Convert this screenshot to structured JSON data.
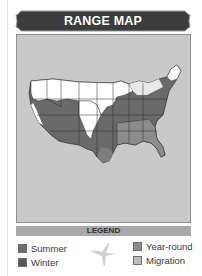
{
  "header": {
    "title": "RANGE MAP"
  },
  "map": {
    "region": "Contiguous United States",
    "background_color": "#c9c9c9",
    "range_colors": {
      "summer": "#6e6e6e",
      "winter": "#575757",
      "year_round": "#8c8c8c",
      "migration": "#bdbdbd",
      "outside_range": "#ffffff"
    }
  },
  "legend": {
    "title": "LEGEND",
    "items": [
      {
        "label": "Summer",
        "color": "#6e6e6e"
      },
      {
        "label": "Winter",
        "color": "#575757"
      },
      {
        "label": "Year-round",
        "color": "#8c8c8c"
      },
      {
        "label": "Migration",
        "color": "#bdbdbd"
      }
    ],
    "icon": "bird-silhouette-icon"
  }
}
